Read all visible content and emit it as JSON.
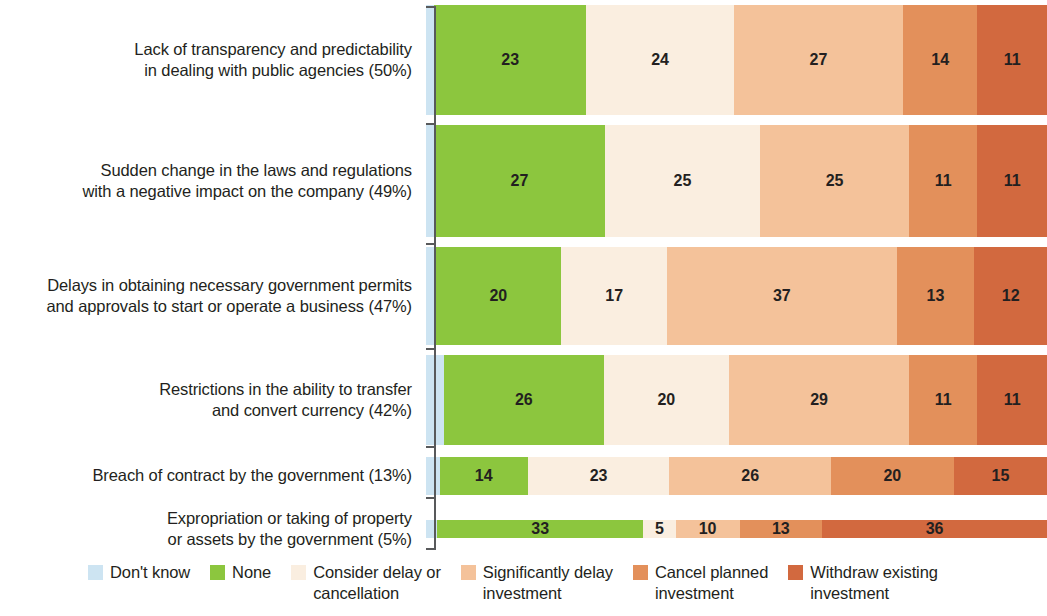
{
  "chart_data": {
    "type": "bar",
    "subtype": "stacked-horizontal-100",
    "title": "",
    "xlabel": "",
    "ylabel": "",
    "grid": false,
    "legend_position": "bottom",
    "xlim": [
      0,
      100
    ],
    "categories": [
      "Lack of transparency and predictability\nin dealing with public agencies (50%)",
      "Sudden change in the laws and regulations\nwith a negative impact on the company (49%)",
      "Delays in obtaining necessary government permits\nand approvals to start or operate a business (47%)",
      "Restrictions in the ability to transfer\nand convert currency (42%)",
      "Breach of contract by the government (13%)",
      "Expropriation or taking of property\nor assets by the government (5%)"
    ],
    "series": [
      {
        "name": "Don't know",
        "color": "#cde4f2",
        "values": [
          1,
          1,
          1,
          3,
          2,
          1
        ]
      },
      {
        "name": "None",
        "color": "#8cc63e",
        "values": [
          23,
          27,
          20,
          26,
          14,
          33
        ]
      },
      {
        "name": "Consider delay or cancellation",
        "color": "#faeee0",
        "values": [
          24,
          25,
          17,
          20,
          23,
          5
        ]
      },
      {
        "name": "Significantly delay investment",
        "color": "#f4c29a",
        "values": [
          27,
          25,
          37,
          29,
          26,
          10
        ]
      },
      {
        "name": "Cancel planned investment",
        "color": "#e3905b",
        "values": [
          14,
          11,
          13,
          11,
          20,
          13
        ]
      },
      {
        "name": "Withdraw existing investment",
        "color": "#d2693f",
        "values": [
          11,
          11,
          12,
          11,
          15,
          36
        ]
      }
    ],
    "rows": [
      {
        "label": "Lack of transparency and predictability\nin dealing with public agencies (50%)",
        "height": 120,
        "bar_height": 110,
        "segments": [
          {
            "series": "Don't know",
            "value": null,
            "label": "",
            "width_pct": 1.3,
            "color": "#cde4f2"
          },
          {
            "series": "None",
            "value": 23,
            "label": "23",
            "width_pct": 24.5,
            "color": "#8cc63e"
          },
          {
            "series": "Consider delay or cancellation",
            "value": 24,
            "label": "24",
            "width_pct": 23.8,
            "color": "#faeee0"
          },
          {
            "series": "Significantly delay investment",
            "value": 27,
            "label": "27",
            "width_pct": 27.2,
            "color": "#f4c29a"
          },
          {
            "series": "Cancel planned investment",
            "value": 14,
            "label": "14",
            "width_pct": 12.0,
            "color": "#e3905b"
          },
          {
            "series": "Withdraw existing investment",
            "value": 11,
            "label": "11",
            "width_pct": 11.2,
            "color": "#d2693f"
          }
        ]
      },
      {
        "label": "Sudden change in the laws and regulations\nwith a negative impact on the company (49%)",
        "height": 122,
        "bar_height": 112,
        "segments": [
          {
            "series": "Don't know",
            "value": null,
            "label": "",
            "width_pct": 1.3,
            "color": "#cde4f2"
          },
          {
            "series": "None",
            "value": 27,
            "label": "27",
            "width_pct": 27.5,
            "color": "#8cc63e"
          },
          {
            "series": "Consider delay or cancellation",
            "value": 25,
            "label": "25",
            "width_pct": 25.0,
            "color": "#faeee0"
          },
          {
            "series": "Significantly delay investment",
            "value": 25,
            "label": "25",
            "width_pct": 24.0,
            "color": "#f4c29a"
          },
          {
            "series": "Cancel planned investment",
            "value": 11,
            "label": "11",
            "width_pct": 11.0,
            "color": "#e3905b"
          },
          {
            "series": "Withdraw existing investment",
            "value": 11,
            "label": "11",
            "width_pct": 11.2,
            "color": "#d2693f"
          }
        ]
      },
      {
        "label": "Delays in obtaining necessary government permits\nand approvals to start or operate a business (47%)",
        "height": 108,
        "bar_height": 98,
        "segments": [
          {
            "series": "Don't know",
            "value": null,
            "label": "",
            "width_pct": 1.5,
            "color": "#cde4f2"
          },
          {
            "series": "None",
            "value": 20,
            "label": "20",
            "width_pct": 20.3,
            "color": "#8cc63e"
          },
          {
            "series": "Consider delay or cancellation",
            "value": 17,
            "label": "17",
            "width_pct": 17.0,
            "color": "#faeee0"
          },
          {
            "series": "Significantly delay investment",
            "value": 37,
            "label": "37",
            "width_pct": 37.0,
            "color": "#f4c29a"
          },
          {
            "series": "Cancel planned investment",
            "value": 13,
            "label": "13",
            "width_pct": 12.5,
            "color": "#e3905b"
          },
          {
            "series": "Withdraw existing investment",
            "value": 12,
            "label": "12",
            "width_pct": 11.7,
            "color": "#d2693f"
          }
        ]
      },
      {
        "label": "Restrictions in the ability to transfer\nand convert currency (42%)",
        "height": 100,
        "bar_height": 90,
        "segments": [
          {
            "series": "Don't know",
            "value": null,
            "label": "",
            "width_pct": 2.9,
            "color": "#cde4f2"
          },
          {
            "series": "None",
            "value": 26,
            "label": "26",
            "width_pct": 25.7,
            "color": "#8cc63e"
          },
          {
            "series": "Consider delay or cancellation",
            "value": 20,
            "label": "20",
            "width_pct": 20.2,
            "color": "#faeee0"
          },
          {
            "series": "Significantly delay investment",
            "value": 29,
            "label": "29",
            "width_pct": 29.0,
            "color": "#f4c29a"
          },
          {
            "series": "Cancel planned investment",
            "value": 11,
            "label": "11",
            "width_pct": 11.0,
            "color": "#e3905b"
          },
          {
            "series": "Withdraw existing investment",
            "value": 11,
            "label": "11",
            "width_pct": 11.2,
            "color": "#d2693f"
          }
        ]
      },
      {
        "label": "Breach of contract by the government (13%)",
        "height": 52,
        "bar_height": 38,
        "segments": [
          {
            "series": "Don't know",
            "value": null,
            "label": "",
            "width_pct": 2.2,
            "color": "#cde4f2"
          },
          {
            "series": "None",
            "value": 14,
            "label": "14",
            "width_pct": 14.2,
            "color": "#8cc63e"
          },
          {
            "series": "Consider delay or cancellation",
            "value": 23,
            "label": "23",
            "width_pct": 22.8,
            "color": "#faeee0"
          },
          {
            "series": "Significantly delay investment",
            "value": 26,
            "label": "26",
            "width_pct": 26.0,
            "color": "#f4c29a"
          },
          {
            "series": "Cancel planned investment",
            "value": 20,
            "label": "20",
            "width_pct": 19.8,
            "color": "#e3905b"
          },
          {
            "series": "Withdraw existing investment",
            "value": 15,
            "label": "15",
            "width_pct": 15.0,
            "color": "#d2693f"
          }
        ]
      },
      {
        "label": "Expropriation or taking of property\nor assets by the government (5%)",
        "height": 54,
        "bar_height": 18,
        "segments": [
          {
            "series": "Don't know",
            "value": null,
            "label": "",
            "width_pct": 1.8,
            "color": "#cde4f2"
          },
          {
            "series": "None",
            "value": 33,
            "label": "33",
            "width_pct": 33.2,
            "color": "#8cc63e"
          },
          {
            "series": "Consider delay or cancellation",
            "value": 5,
            "label": "5",
            "width_pct": 5.2,
            "color": "#faeee0"
          },
          {
            "series": "Significantly delay investment",
            "value": 10,
            "label": "10",
            "width_pct": 10.3,
            "color": "#f4c29a"
          },
          {
            "series": "Cancel planned investment",
            "value": 13,
            "label": "13",
            "width_pct": 13.3,
            "color": "#e3905b"
          },
          {
            "series": "Withdraw existing investment",
            "value": 36,
            "label": "36",
            "width_pct": 36.2,
            "color": "#d2693f"
          }
        ]
      }
    ],
    "legend": [
      {
        "label": "Don't know",
        "color": "#cde4f2"
      },
      {
        "label": "None",
        "color": "#8cc63e"
      },
      {
        "label": "Consider delay or\ncancellation",
        "color": "#faeee0"
      },
      {
        "label": "Significantly delay\ninvestment",
        "color": "#f4c29a"
      },
      {
        "label": "Cancel planned\ninvestment",
        "color": "#e3905b"
      },
      {
        "label": "Withdraw existing\ninvestment",
        "color": "#d2693f"
      }
    ],
    "axis": {
      "spine_color": "#58595b"
    }
  }
}
